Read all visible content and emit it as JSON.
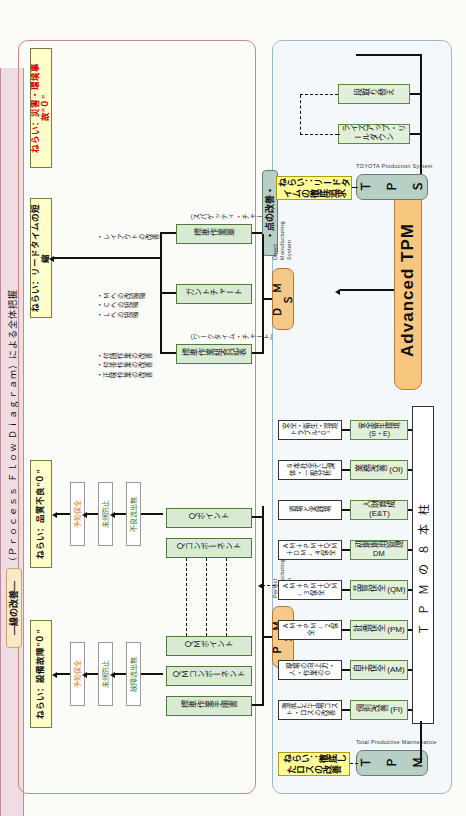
{
  "diagram": {
    "advanced_tpm_label": "Advanced TPM",
    "group_line_label": "—線の改善—",
    "group_point_label": "・点の改善・",
    "pfd_bar": "ＰＦＤ（Ｐｒｏｃｅｓｓ Ｆｌｏｗ Ｄｉａｇｒａｍ）による全体把握"
  },
  "goals": [
    {
      "id": "goal-equipment",
      "text": "ねらい：設備故障”０”",
      "color": "#111111"
    },
    {
      "id": "goal-quality",
      "text": "ねらい：品質不良”０”",
      "color": "#111111"
    },
    {
      "id": "goal-leadtime",
      "text": "ねらい：リードタイムの短縮",
      "color": "#111111"
    },
    {
      "id": "goal-safety",
      "text": "ねらい：災害・環境事故”０”",
      "color": "#cc0000"
    },
    {
      "id": "goal-tpm-loss",
      "text": "ねらい：徹底したロスの改善",
      "color": "#111111"
    },
    {
      "id": "goal-tps-lead",
      "text": "ねらい：リードタイムの徹底追求",
      "color": "#111111"
    }
  ],
  "chain_equipment": [
    {
      "id": "chain-yochi-hozen-1",
      "text": "予知保全",
      "color": "#d2761c"
    },
    {
      "id": "chain-mizen-boushi-1",
      "text": "未然防止",
      "color": "#2e7d32"
    },
    {
      "id": "chain-koshou-ryuushutsu",
      "text": "故障流出無",
      "color": "#2e7d32"
    }
  ],
  "chain_quality": [
    {
      "id": "chain-yochi-hozen-2",
      "text": "予知保全",
      "color": "#d2761c"
    },
    {
      "id": "chain-mizen-boushi-2",
      "text": "未然防止",
      "color": "#2e7d32"
    },
    {
      "id": "chain-furyou-ryuushutsu",
      "text": "不良流出無",
      "color": "#2e7d32"
    }
  ],
  "pms": {
    "abbr": "Ｐ　Ｍ　Ｓ",
    "english": "Perfect\nManufacturing\nSystem",
    "boxes": [
      {
        "id": "pms-std-work-procedure",
        "text": "標準作業手順書"
      },
      {
        "id": "pms-qm-component",
        "text": "ＱＭコンポーネント"
      },
      {
        "id": "pms-qm-point",
        "text": "ＱＭポイント"
      },
      {
        "id": "pms-q-component",
        "text": "Ｑコンポーネント"
      },
      {
        "id": "pms-q-point",
        "text": "Ｑポイント"
      }
    ]
  },
  "dms": {
    "abbr": "Ｄ　Ｍ　Ｓ",
    "english": "Direct\nManufacturing\nSystem",
    "boxes": [
      {
        "id": "dms-std-work-combination",
        "text": "標準作業組合記表",
        "sub": "（ワークタイム・チャート）"
      },
      {
        "id": "dms-gantt-chart",
        "text": "ガントチャート",
        "sub": ""
      },
      {
        "id": "dms-std-work-volume",
        "text": "標準作業量",
        "sub": "（スパゲッティ・チャート）"
      }
    ],
    "bullets_left": "・付随作業の改善\n・付帯作業の改善\n・正味作業の改善",
    "bullets_mid": "・Ｍへの改編縮\n・Ｃへの短縮\n・Ｌへの短縮",
    "bullets_right": "・レイアウトの改善"
  },
  "tpm": {
    "abbr": "Ｔ　Ｐ　Ｍ",
    "english": "Total Productive Maintenance",
    "pillar_band": "ＴＰＭの８本柱",
    "pillars": [
      {
        "id": "pillar-kobetsu-kaizen",
        "name": "個別改善 (FI)",
        "desc": "徹底した工場コスト・ロスの改善"
      },
      {
        "id": "pillar-jishu-hozen",
        "name": "自主保全 (AM)",
        "desc": "現場の向上力・人・作業の０"
      },
      {
        "id": "pillar-keikaku-hozen",
        "name": "計画保全 (PM)",
        "desc": "ＡＭ＋ＰＭ→２保全"
      },
      {
        "id": "pillar-hinshitsu-hozen",
        "name": "品質保全 (QM)",
        "desc": "ＡＭ＋ＰＭ＋ＱＭ→３保全"
      },
      {
        "id": "pillar-shoki-kanri",
        "name": "初期期用管理 DM",
        "desc": "ＡＭ＋ＰＭ＋ＱＭ＋ＤＭ→４保全"
      },
      {
        "id": "pillar-jinzai-ikusei",
        "name": "人財育成 (E&T)",
        "desc": "道場と実践場"
      },
      {
        "id": "pillar-gyoumu-kaizen",
        "name": "業務改善 (OI)",
        "desc": "８本社全てに課体・一般分析"
      },
      {
        "id": "pillar-anzen-eisei",
        "name": "安全衛生環境(S・E)",
        "desc": "安全・衛生・環境トラブル”０”"
      }
    ]
  },
  "tps": {
    "abbr": "Ｔ　Ｐ　Ｓ",
    "english": "TOYOTA Production System",
    "boxes": [
      {
        "id": "tps-lineup-leadtime",
        "text": "ライズアップ・リールダウン"
      },
      {
        "id": "tps-dandori-kae",
        "text": "段取り替え"
      }
    ]
  }
}
